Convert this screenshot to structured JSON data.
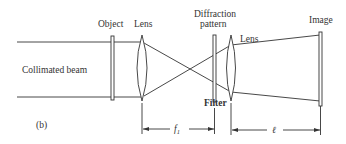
{
  "figure": {
    "panel_label": "(b)",
    "labels": {
      "collimated_beam": "Collimated beam",
      "object": "Object",
      "lens1": "Lens",
      "diffraction_line1": "Diffraction",
      "diffraction_line2": "pattern",
      "lens2": "Lens",
      "image": "Image",
      "filter": "Filter"
    },
    "dimensions": {
      "f1_symbol": "f",
      "f1_subscript": "1",
      "ell_symbol": "ℓ"
    }
  },
  "colors": {
    "ink": "#333333",
    "background": "#ffffff"
  }
}
